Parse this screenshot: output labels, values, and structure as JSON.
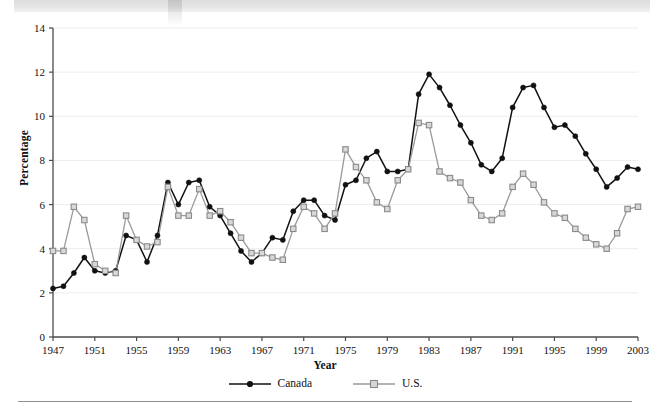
{
  "figure": {
    "ylabel": "Percentage",
    "xlabel": "Year",
    "y_ticks": [
      "0",
      "2",
      "4",
      "6",
      "8",
      "10",
      "12",
      "14"
    ],
    "x_ticks": [
      "1947",
      "1951",
      "1955",
      "1959",
      "1963",
      "1967",
      "1971",
      "1975",
      "1979",
      "1983",
      "1987",
      "1991",
      "1995",
      "1999",
      "2003"
    ],
    "legend": [
      {
        "label": "Canada",
        "marker": "filled-circle-marker",
        "color": "#111111"
      },
      {
        "label": "U.S.",
        "marker": "open-square-marker",
        "color": "#9a9a9a"
      }
    ]
  },
  "chart_data": {
    "type": "line",
    "title": "",
    "subtitle": "",
    "xlabel": "Year",
    "ylabel": "Percentage",
    "xlim": [
      1947,
      2003
    ],
    "ylim": [
      0,
      14
    ],
    "ytick_interval": 2,
    "xtick_interval": 4,
    "grid": "horizontal",
    "legend_position": "bottom-center",
    "x": [
      1947,
      1948,
      1949,
      1950,
      1951,
      1952,
      1953,
      1954,
      1955,
      1956,
      1957,
      1958,
      1959,
      1960,
      1961,
      1962,
      1963,
      1964,
      1965,
      1966,
      1967,
      1968,
      1969,
      1970,
      1971,
      1972,
      1973,
      1974,
      1975,
      1976,
      1977,
      1978,
      1979,
      1980,
      1981,
      1982,
      1983,
      1984,
      1985,
      1986,
      1987,
      1988,
      1989,
      1990,
      1991,
      1992,
      1993,
      1994,
      1995,
      1996,
      1997,
      1998,
      1999,
      2000,
      2001,
      2002,
      2003
    ],
    "series": [
      {
        "name": "Canada",
        "color": "#111111",
        "marker": "filled-circle",
        "values": [
          2.2,
          2.3,
          2.9,
          3.6,
          3.0,
          2.9,
          3.0,
          4.6,
          4.4,
          3.4,
          4.6,
          7.0,
          6.0,
          7.0,
          7.1,
          5.9,
          5.5,
          4.7,
          3.9,
          3.4,
          3.8,
          4.5,
          4.4,
          5.7,
          6.2,
          6.2,
          5.5,
          5.3,
          6.9,
          7.1,
          8.1,
          8.4,
          7.5,
          7.5,
          7.6,
          11.0,
          11.9,
          11.3,
          10.5,
          9.6,
          8.8,
          7.8,
          7.5,
          8.1,
          10.4,
          11.3,
          11.4,
          10.4,
          9.5,
          9.6,
          9.1,
          8.3,
          7.6,
          6.8,
          7.2,
          7.7,
          7.6
        ]
      },
      {
        "name": "U.S.",
        "color": "#9a9a9a",
        "marker": "open-square",
        "values": [
          3.9,
          3.9,
          5.9,
          5.3,
          3.3,
          3.0,
          2.9,
          5.5,
          4.4,
          4.1,
          4.3,
          6.8,
          5.5,
          5.5,
          6.7,
          5.5,
          5.7,
          5.2,
          4.5,
          3.8,
          3.8,
          3.6,
          3.5,
          4.9,
          5.9,
          5.6,
          4.9,
          5.6,
          8.5,
          7.7,
          7.1,
          6.1,
          5.8,
          7.1,
          7.6,
          9.7,
          9.6,
          7.5,
          7.2,
          7.0,
          6.2,
          5.5,
          5.3,
          5.6,
          6.8,
          7.4,
          6.9,
          6.1,
          5.6,
          5.4,
          4.9,
          4.5,
          4.2,
          4.0,
          4.7,
          5.8,
          5.9
        ]
      }
    ]
  }
}
